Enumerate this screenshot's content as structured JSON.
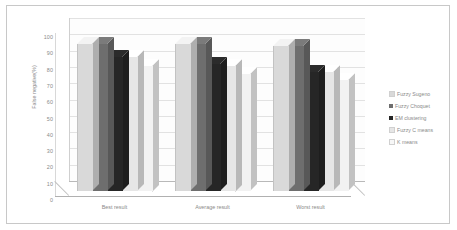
{
  "chart_data": {
    "type": "bar",
    "title": "",
    "xlabel": "",
    "ylabel": "False negative(%)",
    "ylim": [
      0,
      100
    ],
    "ytick_step": 10,
    "yticks": [
      "100",
      "90",
      "80",
      "70",
      "60",
      "50",
      "40",
      "30",
      "20",
      "10",
      "0"
    ],
    "grid": true,
    "legend_position": "right",
    "style": "3d-clustered-column",
    "categories": [
      "Best result",
      "Average result",
      "Worst result"
    ],
    "series": [
      {
        "name": "Fuzzy Sugeno",
        "color": "#d9d9d9",
        "values": [
          90,
          90,
          89
        ]
      },
      {
        "name": "Fuzzy Choquet",
        "color": "#6e6e6e",
        "values": [
          90,
          90,
          89
        ]
      },
      {
        "name": "EM clustering",
        "color": "#262626",
        "values": [
          82,
          78,
          73
        ]
      },
      {
        "name": "Fuzzy C means",
        "color": "#e6e6e6",
        "values": [
          82,
          77,
          73
        ]
      },
      {
        "name": "K means",
        "color": "#f2f2f2",
        "values": [
          77,
          72,
          68
        ]
      }
    ]
  },
  "legend": {
    "items": [
      {
        "label": "Fuzzy Sugeno",
        "color": "#d9d9d9"
      },
      {
        "label": "Fuzzy Choquet",
        "color": "#6e6e6e"
      },
      {
        "label": "EM clustering",
        "color": "#262626"
      },
      {
        "label": "Fuzzy C means",
        "color": "#e6e6e6"
      },
      {
        "label": "K means",
        "color": "#f7f7f7"
      }
    ]
  }
}
